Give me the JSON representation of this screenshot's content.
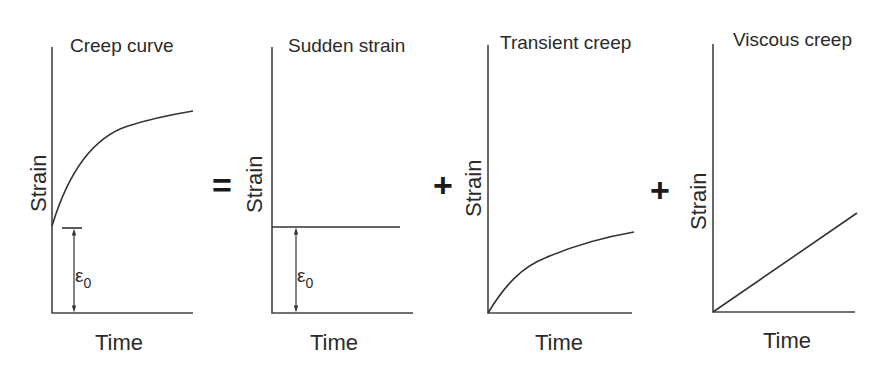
{
  "diagram": {
    "panels": [
      {
        "title": "Creep curve",
        "ylabel": "Strain",
        "xlabel": "Time",
        "annotation": "ε",
        "annotation_sub": "0"
      },
      {
        "title": "Sudden strain",
        "ylabel": "Strain",
        "xlabel": "Time",
        "annotation": "ε",
        "annotation_sub": "0"
      },
      {
        "title": "Transient creep",
        "ylabel": "Strain",
        "xlabel": "Time"
      },
      {
        "title": "Viscous creep",
        "ylabel": "Strain",
        "xlabel": "Time"
      }
    ],
    "operators": [
      "=",
      "+",
      "+"
    ]
  }
}
